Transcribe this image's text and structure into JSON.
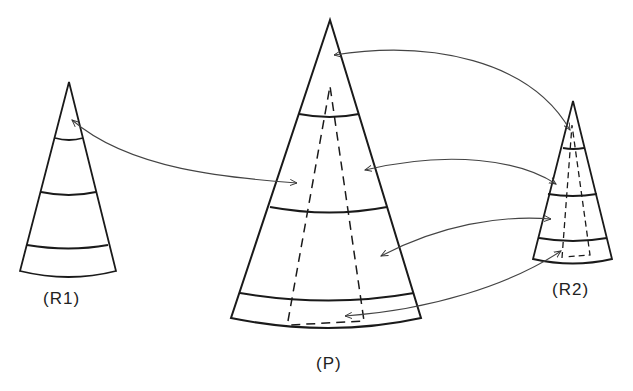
{
  "labels": {
    "r1": "(R1)",
    "p": "(P)",
    "r2": "(R2)"
  },
  "colors": {
    "stroke": "#1a1a1a",
    "arrow": "#444444",
    "background": "#ffffff"
  }
}
